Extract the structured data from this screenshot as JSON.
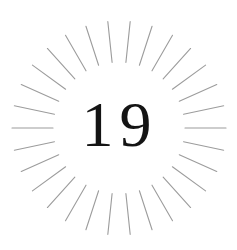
{
  "badge": {
    "number": "19",
    "number_color": "#141414",
    "background_color": "#ffffff"
  },
  "sunburst": {
    "ray_count": 30,
    "angle_offset_deg": 0,
    "center": [
      119,
      128
    ],
    "inner_radius": 66,
    "outer_radius": 107,
    "ray_color": "#9c9c9c"
  }
}
